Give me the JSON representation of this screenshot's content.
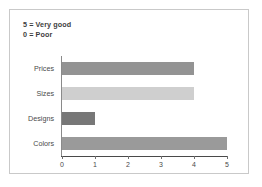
{
  "chart_data": {
    "type": "bar",
    "orientation": "horizontal",
    "title": "",
    "xlabel": "",
    "ylabel": "",
    "categories": [
      "Prices",
      "Sizes",
      "Designs",
      "Colors"
    ],
    "values": [
      4,
      4,
      1,
      5
    ],
    "bar_colors": [
      "#939393",
      "#cfcfcf",
      "#777777",
      "#9a9a9a"
    ],
    "xlim": [
      0,
      5
    ],
    "xticks": [
      0,
      1,
      2,
      3,
      4,
      5
    ],
    "xtick_labels": [
      "0",
      "1",
      "2",
      "3",
      "4",
      "5"
    ],
    "grid": false,
    "legend": null,
    "annotations": [
      "5 = Very good",
      "0 = Poor"
    ]
  },
  "figure": {
    "border_color": "#c9c9c9",
    "background": "#ffffff",
    "axis_color": "#4a4a4a",
    "text_color": "#4a4a4a"
  }
}
